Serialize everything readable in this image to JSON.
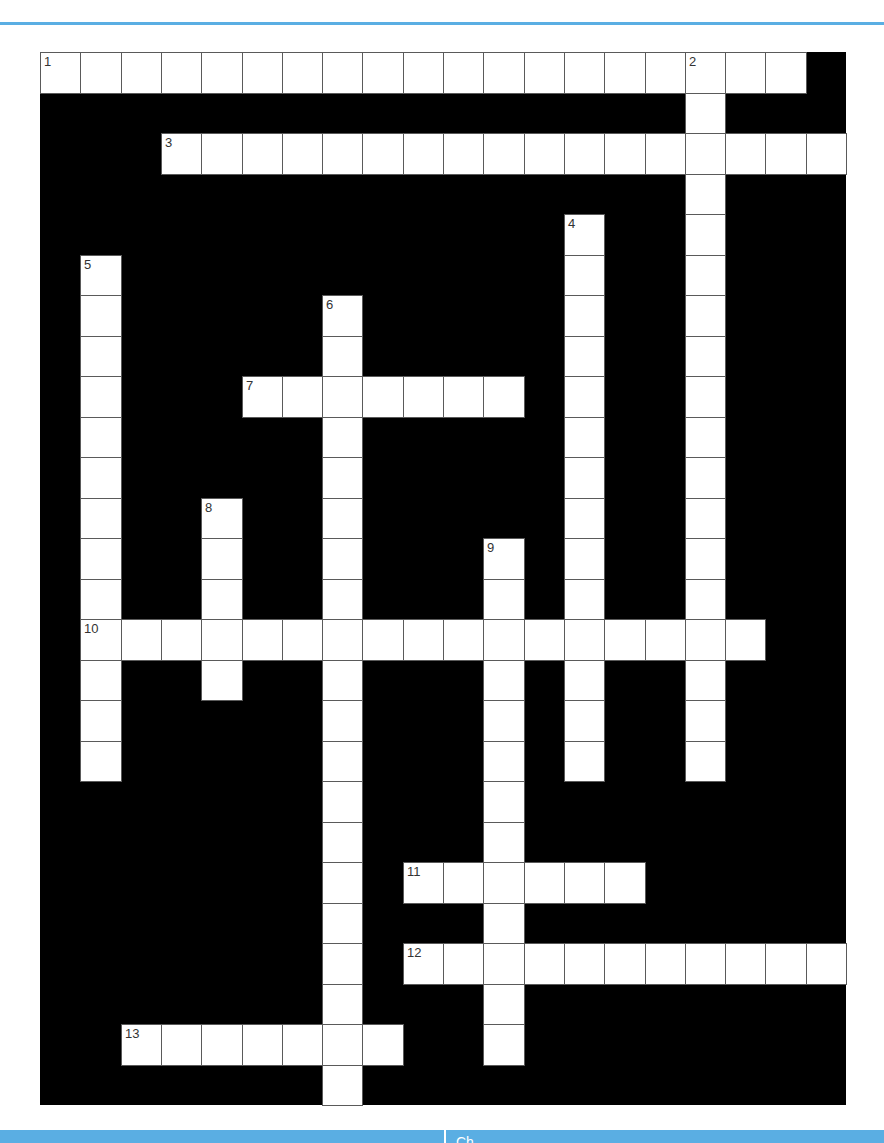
{
  "colors": {
    "accent": "#5aaee3",
    "grid_background": "#000000",
    "cell_fill": "#ffffff",
    "cell_border": "#5a5a5a",
    "number_text": "#333333"
  },
  "grid": {
    "columns": 20,
    "rows": 26,
    "cell_width": 40.3,
    "cell_height": 40.5
  },
  "entries": [
    {
      "number": "1",
      "direction": "across",
      "row": 0,
      "col": 0,
      "length": 19
    },
    {
      "number": "2",
      "direction": "down",
      "row": 0,
      "col": 16,
      "length": 18
    },
    {
      "number": "3",
      "direction": "across",
      "row": 2,
      "col": 3,
      "length": 17
    },
    {
      "number": "4",
      "direction": "down",
      "row": 4,
      "col": 13,
      "length": 14
    },
    {
      "number": "5",
      "direction": "down",
      "row": 5,
      "col": 1,
      "length": 13
    },
    {
      "number": "6",
      "direction": "down",
      "row": 6,
      "col": 7,
      "length": 20
    },
    {
      "number": "7",
      "direction": "across",
      "row": 8,
      "col": 5,
      "length": 7
    },
    {
      "number": "8",
      "direction": "down",
      "row": 11,
      "col": 4,
      "length": 5
    },
    {
      "number": "9",
      "direction": "down",
      "row": 12,
      "col": 11,
      "length": 13
    },
    {
      "number": "10",
      "direction": "across",
      "row": 14,
      "col": 1,
      "length": 17
    },
    {
      "number": "11",
      "direction": "across",
      "row": 20,
      "col": 9,
      "length": 6
    },
    {
      "number": "12",
      "direction": "across",
      "row": 22,
      "col": 9,
      "length": 11
    },
    {
      "number": "13",
      "direction": "across",
      "row": 24,
      "col": 2,
      "length": 7
    }
  ],
  "footer": {
    "label": "Ch"
  }
}
